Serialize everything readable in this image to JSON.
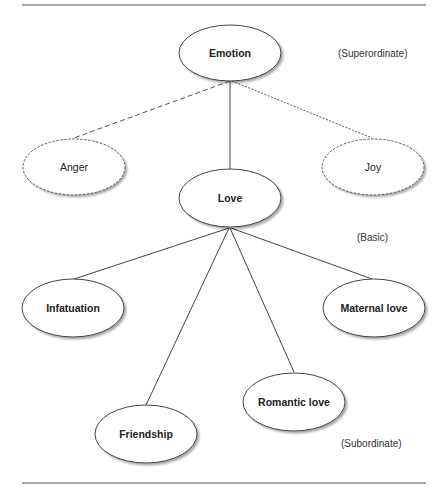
{
  "diagram": {
    "levels": {
      "superordinate": "(Superordinate)",
      "basic": "(Basic)",
      "subordinate": "(Subordinate)"
    },
    "nodes": {
      "emotion": "Emotion",
      "anger": "Anger",
      "joy": "Joy",
      "love": "Love",
      "infatuation": "Infatuation",
      "maternal_love": "Maternal love",
      "friendship": "Friendship",
      "romantic_love": "Romantic love"
    },
    "edges": [
      {
        "from": "Emotion",
        "to": "Anger",
        "style": "dashed"
      },
      {
        "from": "Emotion",
        "to": "Love",
        "style": "solid"
      },
      {
        "from": "Emotion",
        "to": "Joy",
        "style": "dotted"
      },
      {
        "from": "Love",
        "to": "Infatuation",
        "style": "solid"
      },
      {
        "from": "Love",
        "to": "Friendship",
        "style": "solid"
      },
      {
        "from": "Love",
        "to": "Romantic love",
        "style": "solid"
      },
      {
        "from": "Love",
        "to": "Maternal love",
        "style": "solid"
      }
    ]
  }
}
